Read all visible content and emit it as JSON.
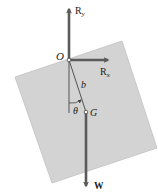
{
  "diagram": {
    "colors": {
      "background": "#ffffff",
      "plate_fill": "#d3d3d3",
      "plate_stroke": "#b8b8b8",
      "vector": "#5a5a5a",
      "line": "#444444",
      "text": "#222222"
    },
    "plate": {
      "corners": [
        [
          15,
          77
        ],
        [
          122,
          41
        ],
        [
          157,
          148
        ],
        [
          52,
          183
        ]
      ]
    },
    "points": {
      "pivot": {
        "label": "O",
        "x": 69,
        "y": 60
      },
      "center_of_gravity": {
        "label": "G",
        "x": 86,
        "y": 112
      }
    },
    "vectors": [
      {
        "name": "R_y",
        "label": "R",
        "subscript": "y",
        "from": [
          69,
          60
        ],
        "to": [
          69,
          5
        ]
      },
      {
        "name": "R_x",
        "label": "R",
        "subscript": "x",
        "from": [
          69,
          60
        ],
        "to": [
          113,
          60
        ]
      },
      {
        "name": "W",
        "label": "W",
        "from": [
          86,
          112
        ],
        "to": [
          86,
          191
        ]
      }
    ],
    "labels": {
      "O": "O",
      "G": "G",
      "b": "b",
      "theta": "θ",
      "Ry_main": "R",
      "Ry_sub": "y",
      "Rx_main": "R",
      "Rx_sub": "x",
      "W": "W"
    }
  }
}
